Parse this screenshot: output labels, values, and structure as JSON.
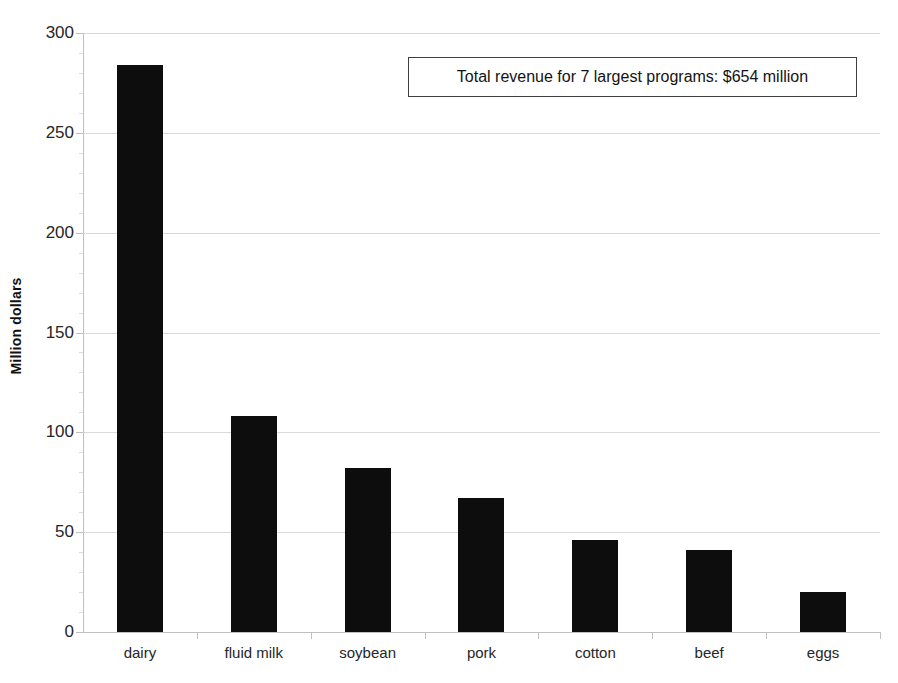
{
  "chart_data": {
    "type": "bar",
    "title": "",
    "xlabel": "",
    "ylabel": "Million dollars",
    "categories": [
      "dairy",
      "fluid milk",
      "soybean",
      "pork",
      "cotton",
      "beef",
      "eggs"
    ],
    "values": [
      284,
      108,
      82,
      67,
      46,
      41,
      20
    ],
    "ylim": [
      0,
      300
    ],
    "yticks": [
      0,
      50,
      100,
      150,
      200,
      250,
      300
    ],
    "ytick_labels": [
      "0",
      "50",
      "100",
      "150",
      "200",
      "250",
      "300"
    ],
    "grid": true,
    "legend": "none",
    "bar_color": "#0d0d0d",
    "annotations": [
      {
        "name": "total-revenue-callout",
        "text": "Total revenue for 7 largest programs: $654 million"
      }
    ]
  },
  "figure": {
    "title_cropped": "",
    "annotation_label": "Total revenue for 7 largest programs: $654 million",
    "y_axis_title": "Million dollars"
  }
}
